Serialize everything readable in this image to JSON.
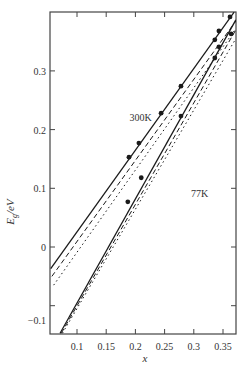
{
  "chart_data": {
    "type": "line",
    "title": "",
    "xlabel": "x",
    "ylabel": "E_g/eV",
    "ylabel_main": "E",
    "ylabel_sub": "g",
    "ylabel_unit": "/eV",
    "xlim": [
      0.053,
      0.372
    ],
    "ylim": [
      -0.15,
      0.42
    ],
    "grid": false,
    "legend": null,
    "x_ticks": [
      0.1,
      0.15,
      0.2,
      0.25,
      0.3,
      0.35
    ],
    "x_tick_labels": [
      "0.1",
      "0.15",
      "0.2",
      "0.25",
      "0.3",
      "0.35"
    ],
    "y_ticks": [
      -0.1,
      0,
      0.1,
      0.2,
      0.3
    ],
    "y_tick_labels": [
      "-0.1",
      "0",
      "0.1",
      "0.2",
      "0.3"
    ],
    "annotations": [
      {
        "text": "300K",
        "x": 0.19,
        "y": 0.215
      },
      {
        "text": "77K",
        "x": 0.295,
        "y": 0.085
      }
    ],
    "series": [
      {
        "name": "300K fit (solid)",
        "style": "solid",
        "temperature": "300K",
        "x": [
          0.055,
          0.369
        ],
        "y": [
          -0.037,
          0.4
        ]
      },
      {
        "name": "300K fit (dashed)",
        "style": "dashed",
        "temperature": "300K",
        "x": [
          0.057,
          0.372
        ],
        "y": [
          -0.05,
          0.385
        ]
      },
      {
        "name": "300K fit (dash-dot)",
        "style": "dashdot",
        "temperature": "300K",
        "x": [
          0.06,
          0.372
        ],
        "y": [
          -0.065,
          0.372
        ]
      },
      {
        "name": "300K data",
        "style": "markers",
        "temperature": "300K",
        "x": [
          0.189,
          0.206,
          0.244,
          0.278,
          0.336,
          0.343,
          0.362
        ],
        "y": [
          0.153,
          0.177,
          0.228,
          0.274,
          0.353,
          0.368,
          0.392
        ]
      },
      {
        "name": "77K fit (solid)",
        "style": "solid",
        "temperature": "77K",
        "x": [
          0.071,
          0.372
        ],
        "y": [
          -0.147,
          0.387
        ]
      },
      {
        "name": "77K fit (dashed)",
        "style": "dashed",
        "temperature": "77K",
        "x": [
          0.073,
          0.372
        ],
        "y": [
          -0.147,
          0.37
        ]
      },
      {
        "name": "77K fit (dash-dot)",
        "style": "dashdot",
        "temperature": "77K",
        "x": [
          0.075,
          0.372
        ],
        "y": [
          -0.147,
          0.355
        ]
      },
      {
        "name": "77K data",
        "style": "markers",
        "temperature": "77K",
        "x": [
          0.187,
          0.21,
          0.278,
          0.336,
          0.343,
          0.364
        ],
        "y": [
          0.077,
          0.118,
          0.223,
          0.322,
          0.341,
          0.363
        ]
      }
    ]
  },
  "colors": {
    "line": "#1a1a1a",
    "axis": "#444444",
    "background": "#ffffff"
  }
}
